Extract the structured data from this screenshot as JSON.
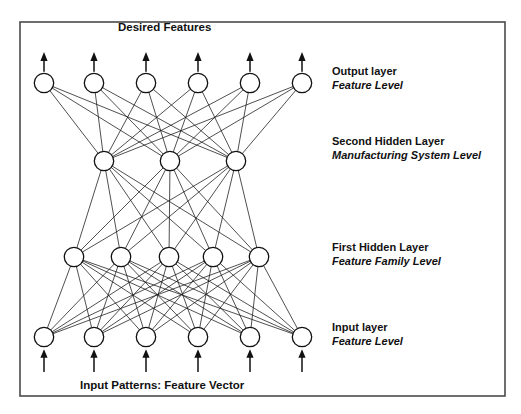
{
  "figure": {
    "title_top": "Desired Features",
    "caption_bottom": "Input Patterns: Feature Vector",
    "frame_color": "#4a4a4a",
    "node_fill": "#ffffff",
    "node_stroke": "#111111",
    "edge_color": "#161616"
  },
  "layers": [
    {
      "id": "output",
      "name_main": "Output layer",
      "name_sub": "Feature Level",
      "node_count": 6,
      "y": 83,
      "node_x": [
        44,
        94,
        146,
        198,
        250,
        302
      ]
    },
    {
      "id": "hidden2",
      "name_main": "Second Hidden Layer",
      "name_sub": "Manufacturing System Level",
      "node_count": 3,
      "y": 161,
      "node_x": [
        104,
        170,
        236
      ]
    },
    {
      "id": "hidden1",
      "name_main": "First Hidden Layer",
      "name_sub": "Feature Family Level",
      "node_count": 5,
      "y": 257,
      "node_x": [
        74,
        121,
        169,
        213,
        259
      ]
    },
    {
      "id": "input",
      "name_main": "Input layer",
      "name_sub": "Feature Level",
      "node_count": 6,
      "y": 337,
      "node_x": [
        44,
        94,
        146,
        198,
        250,
        302
      ]
    }
  ],
  "connections": [
    {
      "from": "input",
      "to": "hidden1",
      "fully_connected": true,
      "edge_count": 30
    },
    {
      "from": "hidden1",
      "to": "hidden2",
      "fully_connected": true,
      "edge_count": 15
    },
    {
      "from": "hidden2",
      "to": "output",
      "fully_connected": true,
      "edge_count": 18
    }
  ],
  "arrows": {
    "input_arrows_count": 6,
    "input_arrow_label": "input-arrow",
    "output_arrows_count": 6,
    "output_arrow_label": "output-arrow"
  },
  "geometry": {
    "frame_x": 20,
    "frame_y": 22,
    "frame_w": 485,
    "frame_h": 374,
    "node_radius": 9.7,
    "label_x": 332,
    "title_x": 118,
    "title_y": 31,
    "caption_x": 80,
    "caption_y": 389,
    "output_arrow_top": 52,
    "input_arrow_bottom": 372
  }
}
